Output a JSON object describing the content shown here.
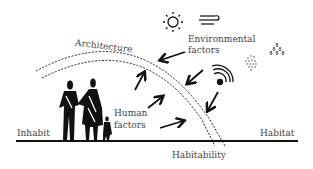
{
  "diagram": {
    "labels": {
      "architecture": "Architecture",
      "environmental_line1": "Environmental",
      "environmental_line2": "factors",
      "human_line1": "Human",
      "human_line2": "factors",
      "inhabit": "Inhabit",
      "habitat": "Habitat",
      "habitability": "Habitability"
    },
    "icons": [
      "sun-icon",
      "wind-icon",
      "signal-waves-icon",
      "dust-particles-icon",
      "rain-drops-icon",
      "family-figures-icon"
    ],
    "colors": {
      "ink": "#111111",
      "text": "#444444",
      "background": "#ffffff"
    }
  }
}
